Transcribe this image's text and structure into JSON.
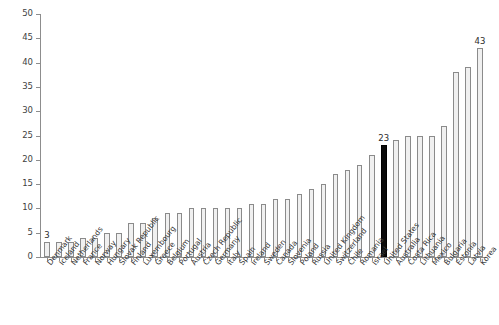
{
  "chart_data": {
    "type": "bar",
    "title": "",
    "subtitle": "",
    "xlabel": "",
    "ylabel": "",
    "ylim": [
      0,
      50
    ],
    "ytick_step": 5,
    "yticks": [
      0,
      5,
      10,
      15,
      20,
      25,
      30,
      35,
      40,
      45,
      50
    ],
    "grid": false,
    "legend": null,
    "orientation": "vertical",
    "sorted": "ascending",
    "categories": [
      "Denmark",
      "Iceland",
      "Netherlands",
      "France",
      "Norway",
      "Hungary",
      "Slovak Republic",
      "Finland",
      "Luxembourg",
      "Greece",
      "Belgium",
      "Portugal",
      "Austria",
      "Czech Republic",
      "Germany",
      "Italy",
      "Spain",
      "Ireland",
      "Sweden",
      "Canada",
      "Slovenia",
      "Poland",
      "Russia",
      "United Kingdom",
      "Switzerland",
      "Chile",
      "Romania",
      "Israel",
      "United States",
      "Australia",
      "Costa Rica",
      "Lithuania",
      "Mexico",
      "Bulgaria",
      "Estonia",
      "Latvia",
      "Korea"
    ],
    "values": [
      3,
      3,
      3,
      4,
      4,
      5,
      5,
      7,
      7,
      8,
      9,
      9,
      10,
      10,
      10,
      10,
      10,
      11,
      11,
      12,
      12,
      13,
      14,
      15,
      17,
      18,
      19,
      21,
      23,
      24,
      25,
      25,
      25,
      27,
      38,
      39,
      43
    ],
    "data_labels": {
      "Denmark": "3",
      "United States": "23",
      "Korea": "43"
    },
    "highlight_category": "United States",
    "colors": {
      "bar_fill": "#f0f0f0",
      "bar_stroke": "#8b8b8b",
      "highlight_fill": "#0a0a0a",
      "highlight_stroke": "#000000",
      "axis": "#8d8d8d",
      "text": "#3a3a3a",
      "background": "#ffffff"
    }
  }
}
